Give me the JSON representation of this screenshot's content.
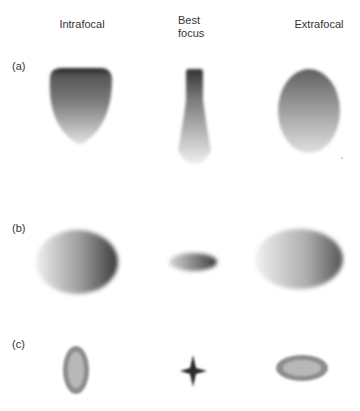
{
  "headers": {
    "intrafocal": "Intrafocal",
    "best_focus_line1": "Best",
    "best_focus_line2": "focus",
    "extrafocal": "Extrafocal"
  },
  "rows": [
    {
      "label": "(a)",
      "description": "Spherical-type aberration: intrafocal dark-topped teardrop, best-focus narrow flask, extrafocal oval"
    },
    {
      "label": "(b)",
      "description": "Tilted ellipses: large intrafocal ellipse, small best-focus ellipse, large extrafocal ellipse"
    },
    {
      "label": "(c)",
      "description": "Astigmatism: vertical ellipse ring, four-point star at best focus, horizontal ellipse ring"
    }
  ],
  "colors": {
    "background": "#ffffff",
    "spot_dark": "#2a2a2a",
    "spot_mid": "#7a7a7a",
    "ring": "#8c8c8c"
  }
}
